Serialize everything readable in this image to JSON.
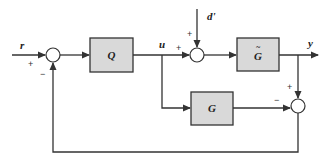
{
  "diagram": {
    "type": "block-diagram",
    "signals": {
      "input": "r",
      "control": "u",
      "disturbance": "d'",
      "output": "y"
    },
    "blocks": [
      {
        "id": "Q",
        "label": "Q"
      },
      {
        "id": "Gtilde",
        "label": "G",
        "accent": "~"
      },
      {
        "id": "G",
        "label": "G"
      }
    ],
    "summing_junctions": [
      {
        "id": "s1",
        "signs": [
          "+",
          "−"
        ]
      },
      {
        "id": "s2",
        "signs": [
          "+",
          "+"
        ]
      },
      {
        "id": "s3",
        "signs": [
          "+",
          "−"
        ]
      }
    ],
    "colors": {
      "block_fill": "#d9d9d9",
      "line": "#333333"
    }
  }
}
